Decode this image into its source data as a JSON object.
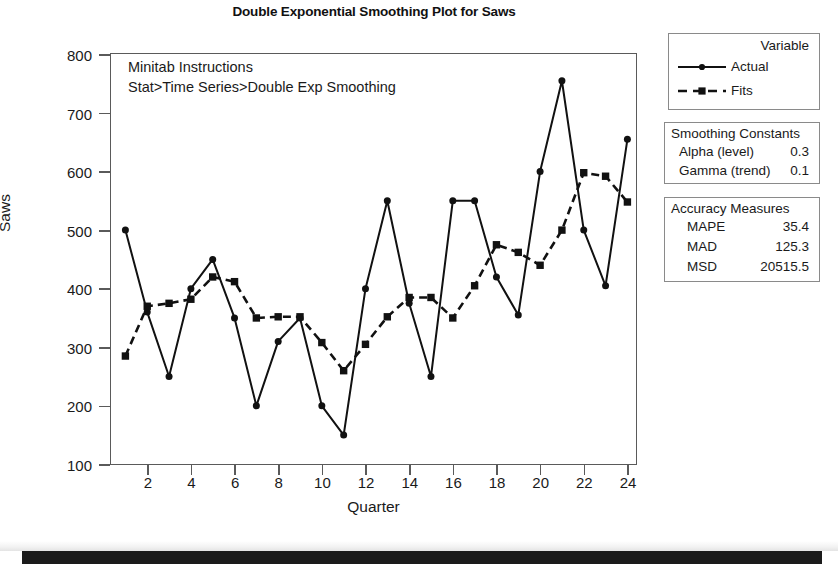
{
  "chart_data": {
    "type": "line",
    "title": "Double Exponential Smoothing Plot for Saws",
    "xlabel": "Quarter",
    "ylabel": "Saws",
    "xlim": [
      1,
      24
    ],
    "ylim": [
      100,
      800
    ],
    "ytick_labels": [
      "800",
      "700",
      "600",
      "500",
      "400",
      "300",
      "200",
      "100"
    ],
    "ytick_values": [
      800,
      700,
      600,
      500,
      400,
      300,
      200,
      100
    ],
    "xtick_labels": [
      "2",
      "4",
      "6",
      "8",
      "10",
      "12",
      "14",
      "16",
      "18",
      "20",
      "22",
      "24"
    ],
    "xtick_values": [
      2,
      4,
      6,
      8,
      10,
      12,
      14,
      16,
      18,
      20,
      22,
      24
    ],
    "grid": false,
    "legend_position": "right-top",
    "x": [
      1,
      2,
      3,
      4,
      5,
      6,
      7,
      8,
      9,
      10,
      11,
      12,
      13,
      14,
      15,
      16,
      17,
      18,
      19,
      20,
      21,
      22,
      23,
      24
    ],
    "series": [
      {
        "name": "Actual",
        "style": "solid",
        "marker": "circle",
        "values": [
          500,
          360,
          250,
          400,
          450,
          350,
          200,
          310,
          350,
          200,
          150,
          400,
          550,
          375,
          250,
          550,
          550,
          420,
          355,
          600,
          755,
          500,
          405,
          655
        ]
      },
      {
        "name": "Fits",
        "style": "dashed",
        "marker": "square",
        "values": [
          285,
          370,
          375,
          382,
          420,
          412,
          350,
          352,
          352,
          308,
          260,
          305,
          352,
          385,
          385,
          350,
          405,
          475,
          462,
          440,
          500,
          598,
          592,
          548
        ]
      }
    ],
    "annotation": "Minitab Instructions\nStat>Time Series>Double Exp Smoothing"
  },
  "legend": {
    "title": "Variable",
    "entries": [
      {
        "label": "Actual",
        "style": "solid",
        "marker": "circle"
      },
      {
        "label": "Fits",
        "style": "dashed",
        "marker": "square"
      }
    ]
  },
  "smoothing_constants": {
    "heading": "Smoothing Constants",
    "rows": [
      {
        "key": "Alpha (level)",
        "value": "0.3"
      },
      {
        "key": "Gamma (trend)",
        "value": "0.1"
      }
    ]
  },
  "accuracy_measures": {
    "heading": "Accuracy Measures",
    "rows": [
      {
        "key": "MAPE",
        "value": "35.4"
      },
      {
        "key": "MAD",
        "value": "125.3"
      },
      {
        "key": "MSD",
        "value": "20515.5"
      }
    ]
  },
  "colors": {
    "ink": "#1a1a1a",
    "frame": "#5a5a5a",
    "box_border": "#8a8a8a",
    "background": "#ffffff"
  }
}
